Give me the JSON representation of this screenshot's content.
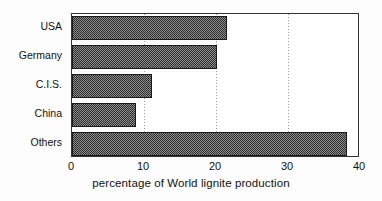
{
  "chart_data": {
    "type": "bar",
    "orientation": "horizontal",
    "title": "",
    "xlabel": "percentage of World lignite production",
    "ylabel": "",
    "categories": [
      "USA",
      "Germany",
      "C.I.S.",
      "China",
      "Others"
    ],
    "values": [
      21.5,
      20.1,
      11.1,
      8.9,
      38.2
    ],
    "series": [
      {
        "name": "percentage of World lignite production",
        "values": [
          21.5,
          20.1,
          11.1,
          8.9,
          38.2
        ]
      }
    ],
    "xlim": [
      0,
      40
    ],
    "xticks": [
      0,
      10,
      20,
      30,
      40
    ],
    "xtick_labels": [
      "0",
      "10",
      "20",
      "30",
      "40"
    ],
    "grid": "vertical-dotted",
    "legend": "none",
    "bar_color": "#2e2e2e",
    "bar_edge_color": "#1a1a1a",
    "plot_border_color": "#333333",
    "background_color": "#ffffff"
  },
  "axis": {
    "title": "percentage of World lignite production",
    "ticks": [
      {
        "label": "0",
        "value": 0
      },
      {
        "label": "10",
        "value": 10
      },
      {
        "label": "20",
        "value": 20
      },
      {
        "label": "30",
        "value": 30
      },
      {
        "label": "40",
        "value": 40
      }
    ]
  },
  "bars": [
    {
      "label": "USA",
      "value": 21.5
    },
    {
      "label": "Germany",
      "value": 20.1
    },
    {
      "label": "C.I.S.",
      "value": 11.1
    },
    {
      "label": "China",
      "value": 8.9
    },
    {
      "label": "Others",
      "value": 38.2
    }
  ]
}
